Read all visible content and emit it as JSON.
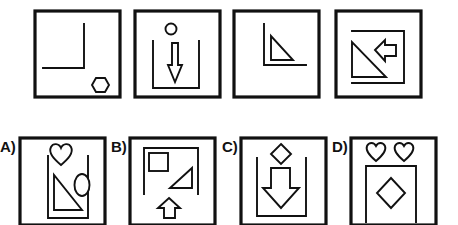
{
  "puzzle": {
    "sequence": [
      {
        "id": 1,
        "contents": [
          "L-corner bracket (top-right vertical, horizontal left)",
          "hexagon bottom-right"
        ]
      },
      {
        "id": 2,
        "contents": [
          "small circle top",
          "U-shaped container",
          "down arrow inside"
        ]
      },
      {
        "id": 3,
        "contents": [
          "L-corner bracket (vertical left, horizontal bottom)",
          "right triangle inside"
        ]
      },
      {
        "id": 4,
        "contents": [
          "open rectangle bracket",
          "right triangle",
          "left arrow"
        ]
      }
    ],
    "options": [
      {
        "label": "A)",
        "contents": [
          "heart top",
          "U-shaped container",
          "right triangle",
          "ellipse"
        ]
      },
      {
        "label": "B)",
        "contents": [
          "inverted U frame",
          "square",
          "right triangle",
          "up arrow below"
        ]
      },
      {
        "label": "C)",
        "contents": [
          "diamond top",
          "U-shaped container",
          "down arrow inside"
        ]
      },
      {
        "label": "D)",
        "contents": [
          "two hearts top",
          "inverted U frame",
          "diamond inside"
        ]
      }
    ]
  },
  "colors": {
    "stroke": "#111111",
    "background": "#ffffff"
  }
}
